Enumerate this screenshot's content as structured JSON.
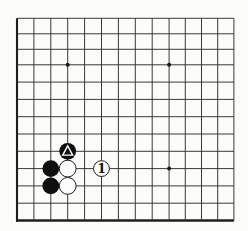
{
  "diagram": {
    "type": "go-board-corner",
    "corner_shown": "bottom-left",
    "grid": {
      "columns_visible": 14,
      "rows_visible": 13
    },
    "star_points": [
      {
        "col": 4,
        "row": 10
      },
      {
        "col": 10,
        "row": 10
      },
      {
        "col": 10,
        "row": 4
      }
    ],
    "stones": [
      {
        "col": 3,
        "row": 4,
        "color": "black"
      },
      {
        "col": 3,
        "row": 3,
        "color": "black"
      },
      {
        "col": 4,
        "row": 5,
        "color": "black",
        "mark": "triangle"
      },
      {
        "col": 4,
        "row": 4,
        "color": "white"
      },
      {
        "col": 4,
        "row": 3,
        "color": "white"
      },
      {
        "col": 6,
        "row": 4,
        "color": "white",
        "label": "1"
      }
    ],
    "colors": {
      "background": "#fcfcfa",
      "grid_line": "#2e2e2e",
      "board_edge": "#1f1f1f",
      "black_stone": "#0f0f0f",
      "white_stone": "#fdfdfd",
      "stone_outline": "#1c1c1c",
      "triangle_mark": "#ffffff",
      "label_color": "#111111",
      "star_point": "#1a1a1a"
    }
  }
}
